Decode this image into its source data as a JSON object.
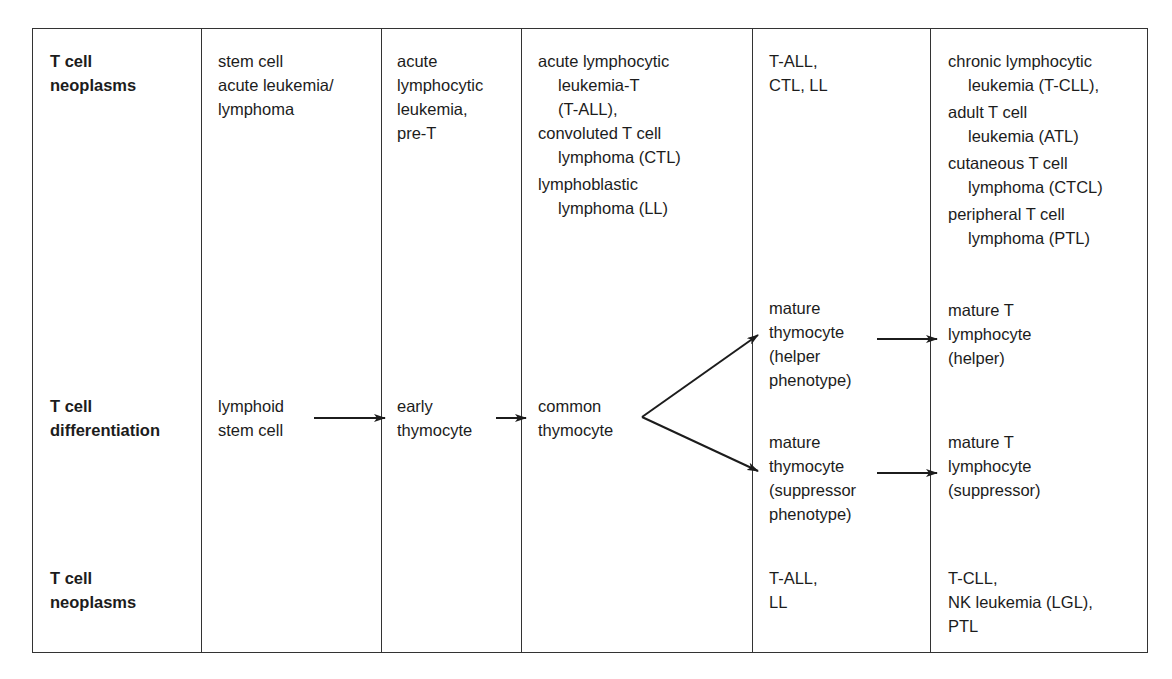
{
  "row_labels": {
    "top": [
      "T cell",
      "neoplasms"
    ],
    "middle": [
      "T cell",
      "differentiation"
    ],
    "bottom": [
      "T cell",
      "neoplasms"
    ]
  },
  "neoplasms_top": {
    "col1": [
      "stem cell",
      "acute leukemia/",
      "lymphoma"
    ],
    "col2": [
      "acute",
      "lymphocytic",
      "leukemia,",
      "pre-T"
    ],
    "col3": {
      "entry1": [
        "acute lymphocytic",
        "leukemia-T",
        "(T-ALL),"
      ],
      "entry2": [
        "convoluted T cell",
        "lymphoma (CTL)"
      ],
      "entry3": [
        "lymphoblastic",
        "lymphoma (LL)"
      ]
    },
    "col4": [
      "T-ALL,",
      "CTL, LL"
    ],
    "col5": {
      "entry1": [
        "chronic lymphocytic",
        "leukemia (T-CLL),"
      ],
      "entry2": [
        "adult T cell",
        "leukemia (ATL)"
      ],
      "entry3": [
        "cutaneous T cell",
        "lymphoma (CTCL)"
      ],
      "entry4": [
        "peripheral T cell",
        "lymphoma (PTL)"
      ]
    }
  },
  "differentiation": {
    "lymphoid_stem_cell": [
      "lymphoid",
      "stem cell"
    ],
    "early_thymocyte": [
      "early",
      "thymocyte"
    ],
    "common_thymocyte": [
      "common",
      "thymocyte"
    ],
    "mature_thymocyte_helper": [
      "mature",
      "thymocyte",
      "(helper",
      "phenotype)"
    ],
    "mature_thymocyte_suppressor": [
      "mature",
      "thymocyte",
      "(suppressor",
      "phenotype)"
    ],
    "mature_t_helper": [
      "mature T",
      "lymphocyte",
      "(helper)"
    ],
    "mature_t_suppressor": [
      "mature T",
      "lymphocyte",
      "(suppressor)"
    ]
  },
  "neoplasms_bottom": {
    "col4": [
      "T-ALL,",
      "LL"
    ],
    "col5": [
      "T-CLL,",
      "NK leukemia (LGL),",
      "PTL"
    ]
  },
  "colors": {
    "line": "#333333",
    "text": "#1c1c1c",
    "background": "#ffffff"
  }
}
